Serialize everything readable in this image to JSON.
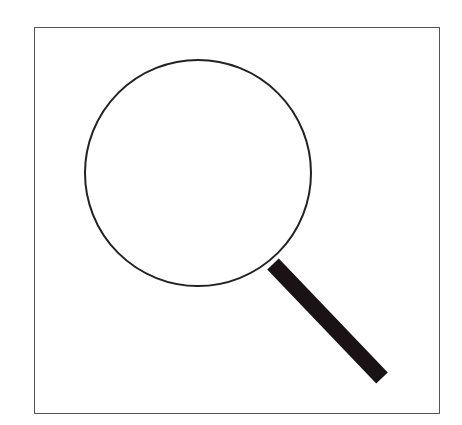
{
  "icon": {
    "name": "magnifying-glass",
    "frame": {
      "x": 34,
      "y": 27,
      "width": 406,
      "height": 387,
      "stroke": "#555555"
    },
    "lens": {
      "cx": 198,
      "cy": 173,
      "r": 113,
      "stroke": "#222222",
      "stroke_width": 2
    },
    "handle": {
      "x1": 273,
      "y1": 264,
      "x2": 382,
      "y2": 378,
      "stroke": "#1a1214",
      "stroke_width": 16
    }
  }
}
